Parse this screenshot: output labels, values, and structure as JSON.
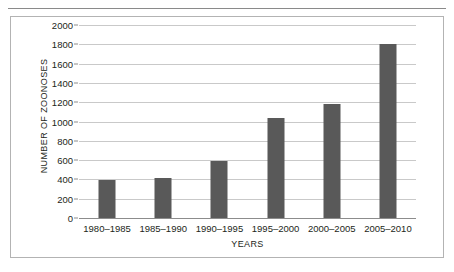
{
  "chart_data": {
    "type": "bar",
    "title": "",
    "xlabel": "YEARS",
    "ylabel": "NUMBER OF ZOONOSES",
    "categories": [
      "1980–1985",
      "1985–1990",
      "1990–1995",
      "1995–2000",
      "2000–2005",
      "2005–2010"
    ],
    "values": [
      395,
      412,
      595,
      1035,
      1185,
      1800
    ],
    "ylim": [
      0,
      2000
    ],
    "yticks": [
      0,
      200,
      400,
      600,
      800,
      1000,
      1200,
      1400,
      1600,
      1800,
      2000
    ],
    "ytick_labels": [
      "0",
      "200",
      "400",
      "600",
      "800",
      "1000",
      "1200",
      "1400",
      "1600",
      "1800",
      "2000"
    ],
    "grid": true,
    "legend": false,
    "bar_color": "#595959",
    "grid_color": "#c9c9c9",
    "axis_color": "#8c8c8c",
    "frame_color": "#b3b3b3",
    "text_color": "#231f20"
  }
}
